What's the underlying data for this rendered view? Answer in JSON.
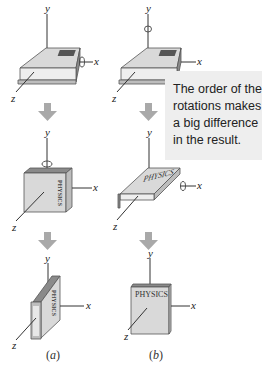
{
  "figure": {
    "columns": [
      {
        "id": "a",
        "label": "(a)",
        "label_letter": "a",
        "steps": [
          {
            "state": "initial",
            "rotation_axis": "x",
            "spine_text": "PHYSICS"
          },
          {
            "state": "after-first-rotation",
            "rotation_axis": "y",
            "spine_text": "PHYSICS"
          },
          {
            "state": "final",
            "rotation_axis": "",
            "spine_text": "PHYSICS"
          }
        ]
      },
      {
        "id": "b",
        "label": "(b)",
        "label_letter": "b",
        "steps": [
          {
            "state": "initial",
            "rotation_axis": "y",
            "cover_text": "PHYSICS"
          },
          {
            "state": "after-first-rotation",
            "rotation_axis": "x",
            "cover_text": "PHYSICS"
          },
          {
            "state": "final",
            "rotation_axis": "",
            "cover_text": "PHYSICS"
          }
        ]
      }
    ],
    "axes": {
      "x": "x",
      "y": "y",
      "z": "z"
    },
    "book_title": "PHYSICS",
    "callout": {
      "lines": [
        "The order of the",
        "rotations makes",
        "a big difference",
        "in the result."
      ]
    },
    "colors": {
      "book_face": "#d9d9d9",
      "book_side": "#bdbdbd",
      "book_edge": "#555555",
      "pages": "#ececec",
      "arrow": "#a9a9a9",
      "callout_bg": "#eeeeee",
      "text": "#222222"
    }
  }
}
